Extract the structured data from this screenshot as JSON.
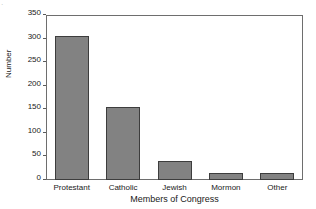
{
  "corner_mark": "·",
  "chart_data": {
    "type": "bar",
    "title": "",
    "xlabel": "Members of Congress",
    "ylabel": "Number",
    "categories": [
      "Protestant",
      "Catholic",
      "Jewish",
      "Mormon",
      "Other"
    ],
    "values": [
      305,
      155,
      40,
      15,
      14
    ],
    "ylim": [
      0,
      350
    ],
    "yticks": [
      0,
      50,
      100,
      150,
      200,
      250,
      300,
      350
    ],
    "ytick_labels": [
      "0",
      "50",
      "100",
      "150",
      "200",
      "250",
      "300",
      "350"
    ],
    "grid": false,
    "legend": null,
    "bar_color": "#828282",
    "bar_edge_color": "#3d3d3d",
    "axis_color": "#6e6e6e",
    "text_color": "#1a1a1a"
  }
}
